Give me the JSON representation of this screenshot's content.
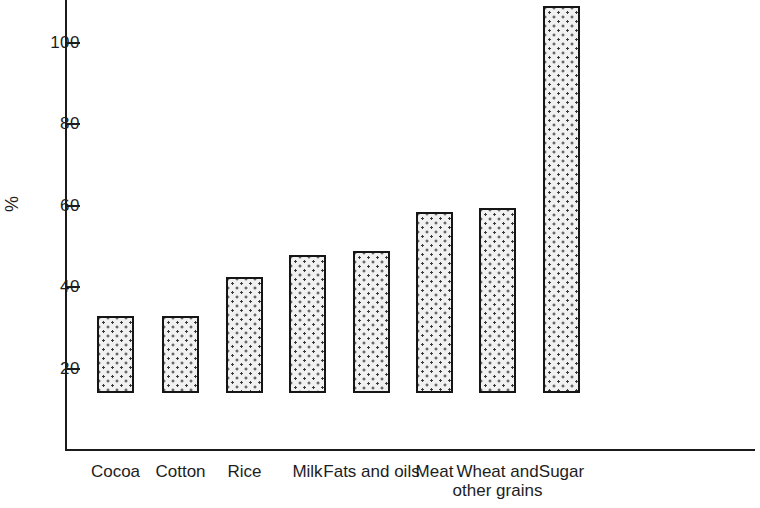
{
  "chart_data": {
    "type": "bar",
    "title": "",
    "subtitle": "",
    "xlabel": "",
    "ylabel": "%",
    "categories": [
      "Cocoa",
      "Cotton",
      "Rice",
      "Milk",
      "Fats and oils",
      "Meat",
      "Wheat and other grains",
      "Sugar"
    ],
    "category_lines": [
      [
        "Cocoa"
      ],
      [
        "Cotton"
      ],
      [
        "Rice"
      ],
      [
        "Milk"
      ],
      [
        "Fats and oils"
      ],
      [
        "Meat"
      ],
      [
        "Wheat and",
        "other grains"
      ],
      [
        "Sugar"
      ]
    ],
    "values": [
      19,
      19,
      28.5,
      34,
      35,
      44.5,
      45.5,
      95
    ],
    "ylim": [
      0,
      110
    ],
    "ytick_values": [
      20,
      40,
      60,
      80,
      100
    ],
    "ytick_labels": [
      "20",
      "40",
      "60",
      "80",
      "100"
    ],
    "grid": false,
    "legend": null,
    "bar_fill": "#f1f1f1",
    "bar_edge": "#151515",
    "axis_color": "#1b1b1b",
    "text_color": "#1d1d1d"
  },
  "axis": {
    "y_title": "%"
  }
}
